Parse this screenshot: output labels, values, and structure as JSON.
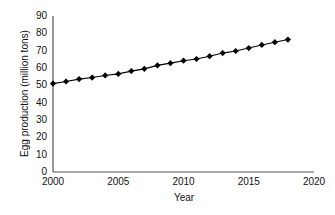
{
  "chart_data": {
    "type": "line",
    "title": "",
    "xlabel": "Year",
    "ylabel": "Egg production (million tons)",
    "xlim": [
      2000,
      2020
    ],
    "ylim": [
      0,
      90
    ],
    "grid": false,
    "legend": false,
    "marker": "diamond",
    "line_color": "#000000",
    "marker_color": "#000000",
    "x_ticks": [
      2000,
      2005,
      2010,
      2015,
      2020
    ],
    "x_tick_labels": [
      "2000",
      "2005",
      "2010",
      "2015",
      "2020"
    ],
    "y_ticks": [
      0,
      10,
      20,
      30,
      40,
      50,
      60,
      70,
      80,
      90
    ],
    "y_tick_labels": [
      "0",
      "10",
      "20",
      "30",
      "40",
      "50",
      "60",
      "70",
      "80",
      "90"
    ],
    "x": [
      2000,
      2001,
      2002,
      2003,
      2004,
      2005,
      2006,
      2007,
      2008,
      2009,
      2010,
      2011,
      2012,
      2013,
      2014,
      2015,
      2016,
      2017,
      2018
    ],
    "values": [
      51,
      52.2,
      53.6,
      54.5,
      55.7,
      56.6,
      58.2,
      59.5,
      61.5,
      62.8,
      64.2,
      65.2,
      66.8,
      68.6,
      69.8,
      71.5,
      73.3,
      74.9,
      76.4
    ],
    "series": [
      {
        "name": "Egg production",
        "values": [
          51,
          52.2,
          53.6,
          54.5,
          55.7,
          56.6,
          58.2,
          59.5,
          61.5,
          62.8,
          64.2,
          65.2,
          66.8,
          68.6,
          69.8,
          71.5,
          73.3,
          74.9,
          76.4
        ]
      }
    ]
  }
}
